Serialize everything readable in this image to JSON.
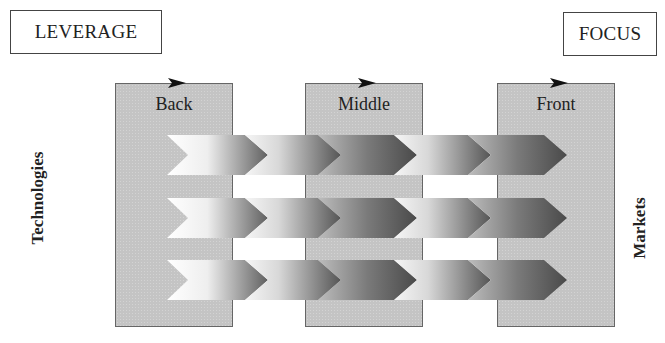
{
  "diagram": {
    "top_left_label": "LEVERAGE",
    "top_right_label": "FOCUS",
    "left_axis_label": "Technologies",
    "right_axis_label": "Markets",
    "stages": [
      {
        "label": "Back"
      },
      {
        "label": "Middle"
      },
      {
        "label": "Front"
      }
    ],
    "rows": 3,
    "chevrons_per_row": 5,
    "colors": {
      "stage_fill": "#c4c4c4",
      "stage_border": "#666666",
      "chevron_light": "#f4f4f4",
      "chevron_dark": "#5a5a5a",
      "text": "#222222"
    }
  }
}
